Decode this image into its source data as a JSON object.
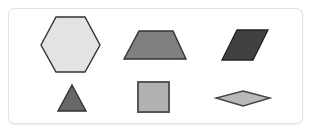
{
  "panel": {
    "name": "shapes-panel",
    "background_color": "#ffffff",
    "border_color": "#e2e2e2",
    "corner_radius": 7,
    "bounds": {
      "x": 8,
      "y": 8,
      "width": 295,
      "height": 116
    }
  },
  "shapes": [
    {
      "id": "hexagon",
      "label": "Hexagon",
      "row": 1,
      "column": 1,
      "sides": 6,
      "fill_color": "#e3e3e3",
      "stroke_color": "#333333",
      "stroke_width": 1.4,
      "points": "41,45 56,17 85,17 100,45 85,72 56,72",
      "bounds": {
        "x": 41,
        "y": 17,
        "width": 59,
        "height": 55
      }
    },
    {
      "id": "trapezoid",
      "label": "Trapezoid",
      "row": 1,
      "column": 2,
      "sides": 4,
      "fill_color": "#808080",
      "stroke_color": "#333333",
      "stroke_width": 1.4,
      "points": "139,31 173,31 186,59 124,59",
      "bounds": {
        "x": 124,
        "y": 31,
        "width": 62,
        "height": 28
      }
    },
    {
      "id": "parallelogram",
      "label": "Parallelogram",
      "row": 1,
      "column": 3,
      "sides": 4,
      "fill_color": "#414141",
      "stroke_color": "#232323",
      "stroke_width": 1.3,
      "points": "237,30 268,30 253,60 222,60",
      "bounds": {
        "x": 222,
        "y": 30,
        "width": 46,
        "height": 30
      }
    },
    {
      "id": "triangle",
      "label": "Triangle",
      "row": 2,
      "column": 1,
      "sides": 3,
      "fill_color": "#676767",
      "stroke_color": "#333333",
      "stroke_width": 1.4,
      "points": "72,85 86,111 58,111",
      "bounds": {
        "x": 58,
        "y": 85,
        "width": 28,
        "height": 26
      }
    },
    {
      "id": "square",
      "label": "Square",
      "row": 2,
      "column": 2,
      "sides": 4,
      "fill_color": "#b1b1b1",
      "stroke_color": "#575757",
      "stroke_width": 2.0,
      "points": "138,82 169,82 169,112 138,112",
      "bounds": {
        "x": 138,
        "y": 82,
        "width": 31,
        "height": 30
      }
    },
    {
      "id": "rhombus",
      "label": "Rhombus",
      "row": 2,
      "column": 3,
      "sides": 4,
      "fill_color": "#b9b9b9",
      "stroke_color": "#454545",
      "stroke_width": 1.4,
      "points": "243,91 270,98 243,106 216,98",
      "bounds": {
        "x": 216,
        "y": 91,
        "width": 54,
        "height": 15
      }
    }
  ]
}
